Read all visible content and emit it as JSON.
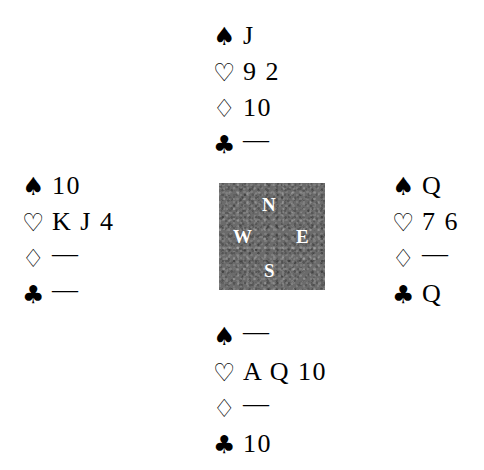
{
  "diagram": {
    "type": "bridge-hand-diagram",
    "suit_symbols": {
      "spade": "♠",
      "heart": "♡",
      "diamond": "♢",
      "club": "♣"
    },
    "void_mark": "—",
    "compass": {
      "north": "N",
      "west": "W",
      "east": "E",
      "south": "S",
      "background_color": "#6b6b6b",
      "text_color": "#ffffff"
    },
    "hands": {
      "north": {
        "position_label": "N",
        "spades": "J",
        "hearts": "9 2",
        "diamonds": "10",
        "clubs": "—"
      },
      "west": {
        "position_label": "W",
        "spades": "10",
        "hearts": "K J 4",
        "diamonds": "—",
        "clubs": "—"
      },
      "east": {
        "position_label": "E",
        "spades": "Q",
        "hearts": "7 6",
        "diamonds": "—",
        "clubs": "Q"
      },
      "south": {
        "position_label": "S",
        "spades": "—",
        "hearts": "A Q 10",
        "diamonds": "—",
        "clubs": "10"
      }
    }
  }
}
